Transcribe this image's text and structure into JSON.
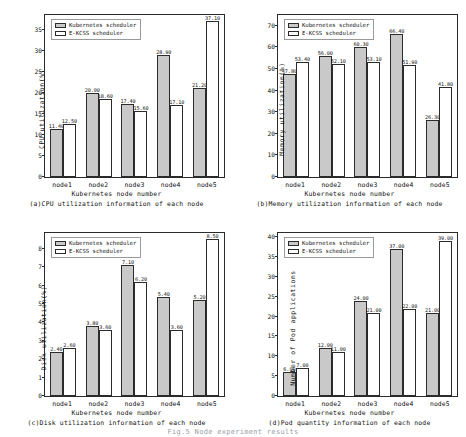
{
  "legend": {
    "series": [
      {
        "key": "k8s",
        "label": "Kubernetes scheduler",
        "color": "#c9c9c9"
      },
      {
        "key": "ekcss",
        "label": "E-KCSS scheduler",
        "color": "#ffffff"
      }
    ]
  },
  "common": {
    "xlabel": "Kubernetes node number",
    "categories": [
      "node1",
      "node2",
      "node3",
      "node4",
      "node5"
    ]
  },
  "bottom_caption": "Fig.5 Node experiment results",
  "chart_data": [
    {
      "id": "a",
      "type": "bar",
      "title": "(a)CPU utilization information of each node",
      "xlabel": "Kubernetes node number",
      "ylabel": "CPU utilization(%)",
      "categories": [
        "node1",
        "node2",
        "node3",
        "node4",
        "node5"
      ],
      "yticks": [
        0,
        5,
        10,
        15,
        20,
        25,
        30,
        35
      ],
      "ylim": [
        0,
        38.5
      ],
      "grid": false,
      "legend_position": "top-left",
      "series": [
        {
          "name": "Kubernetes scheduler",
          "values": [
            11.4,
            20.0,
            17.4,
            28.9,
            21.2
          ],
          "labels": [
            "11.40",
            "20.00",
            "17.40",
            "28.90",
            "21.20"
          ]
        },
        {
          "name": "E-KCSS scheduler",
          "values": [
            12.5,
            18.6,
            15.6,
            17.1,
            37.1
          ],
          "labels": [
            "12.50",
            "18.60",
            "15.60",
            "17.10",
            "37.10"
          ]
        }
      ]
    },
    {
      "id": "b",
      "type": "bar",
      "title": "(b)Memory utilization information of each node",
      "xlabel": "Kubernetes node number",
      "ylabel": "Memory utilization(%)",
      "categories": [
        "node1",
        "node2",
        "node3",
        "node4",
        "node5"
      ],
      "yticks": [
        0,
        10,
        20,
        30,
        40,
        50,
        60,
        70
      ],
      "ylim": [
        0,
        75
      ],
      "grid": false,
      "legend_position": "top-left",
      "series": [
        {
          "name": "Kubernetes scheduler",
          "values": [
            47.8,
            56.0,
            60.3,
            66.4,
            26.3
          ],
          "labels": [
            "47.80",
            "56.00",
            "60.30",
            "66.40",
            "26.30"
          ]
        },
        {
          "name": "E-KCSS scheduler",
          "values": [
            53.4,
            52.1,
            53.1,
            51.9,
            41.8
          ],
          "labels": [
            "53.40",
            "52.10",
            "53.10",
            "51.90",
            "41.80"
          ]
        }
      ]
    },
    {
      "id": "c",
      "type": "bar",
      "title": "(c)Disk utilization information of each node",
      "xlabel": "Kubernetes node number",
      "ylabel": "Disk utilization(%)",
      "categories": [
        "node1",
        "node2",
        "node3",
        "node4",
        "node5"
      ],
      "yticks": [
        0,
        1,
        2,
        3,
        4,
        5,
        6,
        7,
        8
      ],
      "ylim": [
        0,
        8.85
      ],
      "grid": false,
      "legend_position": "top-left",
      "series": [
        {
          "name": "Kubernetes scheduler",
          "values": [
            2.4,
            3.8,
            7.1,
            5.4,
            5.2
          ],
          "labels": [
            "2.40",
            "3.80",
            "7.10",
            "5.40",
            "5.20"
          ]
        },
        {
          "name": "E-KCSS scheduler",
          "values": [
            2.6,
            3.6,
            6.2,
            3.6,
            8.5
          ],
          "labels": [
            "2.60",
            "3.60",
            "6.20",
            "3.60",
            "8.50"
          ]
        }
      ]
    },
    {
      "id": "d",
      "type": "bar",
      "title": "(d)Pod quantity information of each node",
      "xlabel": "Kubernetes node number",
      "ylabel": "Number of Pod applications",
      "categories": [
        "node1",
        "node2",
        "node3",
        "node4",
        "node5"
      ],
      "yticks": [
        0,
        5,
        10,
        15,
        20,
        25,
        30,
        35,
        40
      ],
      "ylim": [
        0,
        41
      ],
      "grid": false,
      "legend_position": "top-left",
      "series": [
        {
          "name": "Kubernetes scheduler",
          "values": [
            6.0,
            12.0,
            24.0,
            37.0,
            21.0
          ],
          "labels": [
            "6.00",
            "12.00",
            "24.00",
            "37.00",
            "21.00"
          ]
        },
        {
          "name": "E-KCSS scheduler",
          "values": [
            7.0,
            11.0,
            21.0,
            22.0,
            39.0
          ],
          "labels": [
            "7.00",
            "11.00",
            "21.00",
            "22.00",
            "39.00"
          ]
        }
      ]
    }
  ]
}
